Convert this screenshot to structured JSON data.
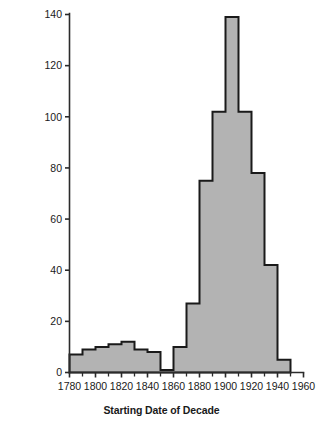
{
  "chart_data": {
    "type": "bar",
    "title": "",
    "subtitle": "",
    "xlabel": "Starting Date of Decade",
    "ylabel": "Number of European Provinces with Fertility Drops",
    "categories": [
      1780,
      1790,
      1800,
      1810,
      1820,
      1830,
      1840,
      1850,
      1860,
      1870,
      1880,
      1890,
      1900,
      1910,
      1920,
      1930,
      1940
    ],
    "values": [
      7,
      9,
      10,
      11,
      12,
      9,
      8,
      1,
      10,
      27,
      75,
      102,
      139,
      102,
      78,
      42,
      5
    ],
    "bin_width": 10,
    "xlim": [
      1780,
      1960
    ],
    "ylim": [
      0,
      140
    ],
    "xticks": [
      1780,
      1800,
      1820,
      1840,
      1860,
      1880,
      1900,
      1920,
      1940,
      1960
    ],
    "xtick_labels": [
      "1780",
      "1800",
      "1820",
      "1840",
      "1860",
      "1880",
      "1900",
      "1920",
      "1940",
      "1960"
    ],
    "xminor_ticks": [
      1790,
      1810,
      1830,
      1850,
      1870,
      1890,
      1910,
      1930,
      1950
    ],
    "yticks": [
      0,
      20,
      40,
      60,
      80,
      100,
      120,
      140
    ],
    "ytick_labels": [
      "0",
      "20",
      "40",
      "60",
      "80",
      "100",
      "120",
      "140"
    ],
    "grid": false,
    "legend": "none",
    "bar_fill_color": "#b3b3b3",
    "bar_edge_color": "#1a1a1a",
    "axis_color": "#2b2b2b",
    "background_color": "#ffffff"
  }
}
